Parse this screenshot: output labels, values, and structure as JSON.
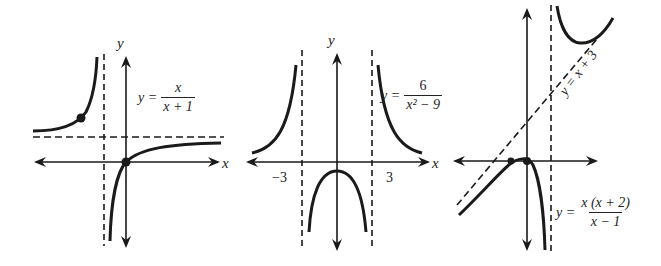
{
  "figure": {
    "graphs": [
      {
        "id": "graph1",
        "equation": {
          "lhs": "y =",
          "numerator": "x",
          "denominator": "x + 1"
        },
        "axis_labels": {
          "x": "x",
          "y": "y"
        },
        "asymptotes": {
          "vertical": "x = -1",
          "horizontal": "y = 1"
        },
        "marked_points": [
          "(0, 0)",
          "point on left branch"
        ]
      },
      {
        "id": "graph2",
        "equation": {
          "lhs": "y =",
          "numerator": "6",
          "denominator": "x² − 9"
        },
        "axis_labels": {
          "x": "x",
          "y": "y"
        },
        "tick_labels": [
          "−3",
          "3"
        ],
        "asymptotes": {
          "vertical": [
            "x = -3",
            "x = 3"
          ],
          "horizontal": "y = 0"
        }
      },
      {
        "id": "graph3",
        "equation": {
          "lhs": "y =",
          "numerator": "x (x + 2)",
          "denominator": "x − 1"
        },
        "slant_asymptote_label": "y = x + 3",
        "asymptotes": {
          "vertical": "x = 1",
          "slant": "y = x + 3"
        },
        "marked_points": [
          "(0, 0)",
          "(-2, 0)"
        ]
      }
    ],
    "colors": {
      "ink": "#1a1a1a",
      "background": "#ffffff"
    }
  }
}
